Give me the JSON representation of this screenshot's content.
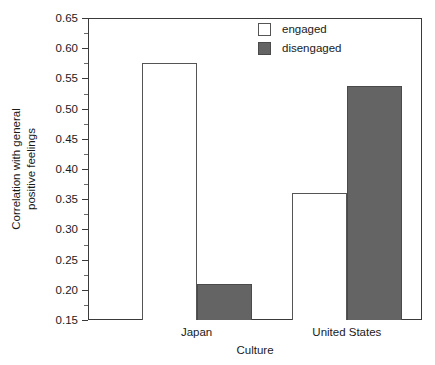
{
  "chart_data": {
    "type": "bar",
    "title": "",
    "xlabel": "Culture",
    "ylabel": "Correlation with general positive feelings",
    "ylabel_line1": "Correlation with general",
    "ylabel_line2": "positive feelings",
    "categories": [
      "Japan",
      "United States"
    ],
    "series": [
      {
        "name": "engaged",
        "values": [
          0.575,
          0.36
        ],
        "color": "#ffffff"
      },
      {
        "name": "disengaged",
        "values": [
          0.21,
          0.538
        ],
        "color": "#646464"
      }
    ],
    "ylim": [
      0.15,
      0.65
    ],
    "ytick_step": 0.05,
    "yticks": [
      0.15,
      0.2,
      0.25,
      0.3,
      0.35,
      0.4,
      0.45,
      0.5,
      0.55,
      0.6,
      0.65
    ],
    "ytick_labels": [
      "0.15",
      "0.20",
      "0.25",
      "0.30",
      "0.35",
      "0.40",
      "0.45",
      "0.50",
      "0.55",
      "0.60",
      "0.65"
    ],
    "yminor_ticks": [
      0.175,
      0.225,
      0.275,
      0.325,
      0.375,
      0.425,
      0.475,
      0.525,
      0.575,
      0.625
    ],
    "grid": false,
    "legend_position": "top-right",
    "legend_entries": [
      "engaged",
      "disengaged"
    ],
    "frame": true,
    "axis_color": "#3a3a3a"
  }
}
